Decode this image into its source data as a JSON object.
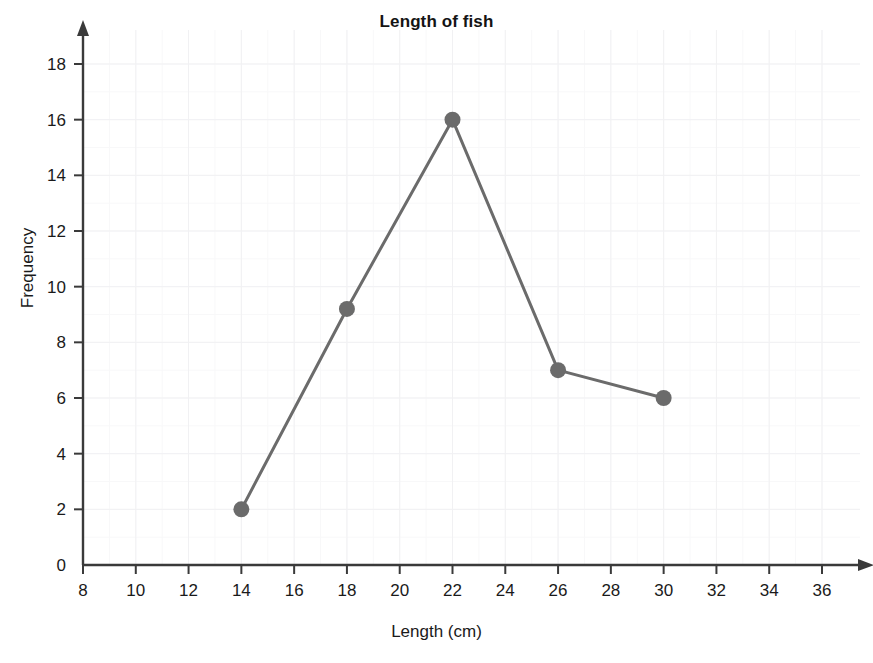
{
  "chart_data": {
    "type": "line",
    "title": "Length of fish",
    "xlabel": "Length (cm)",
    "ylabel": "Frequency",
    "xlim": [
      8,
      36
    ],
    "ylim": [
      0,
      18
    ],
    "xticks": [
      8,
      10,
      12,
      14,
      16,
      18,
      20,
      22,
      24,
      26,
      28,
      30,
      32,
      34,
      36
    ],
    "yticks": [
      0,
      2,
      4,
      6,
      8,
      10,
      12,
      14,
      16,
      18
    ],
    "grid": true,
    "legend": null,
    "series": [
      {
        "name": "Frequency of fish length",
        "x": [
          14,
          18,
          22,
          26,
          30
        ],
        "values": [
          2,
          9.2,
          16,
          7,
          6
        ],
        "color": "#6b6b6b",
        "marker": "circle"
      }
    ],
    "points": [
      {
        "x": 14,
        "y": 2
      },
      {
        "x": 18,
        "y": 9.2
      },
      {
        "x": 22,
        "y": 16
      },
      {
        "x": 26,
        "y": 7
      },
      {
        "x": 30,
        "y": 6
      }
    ],
    "colors": {
      "line": "#6b6b6b",
      "marker": "#6b6b6b",
      "axis": "#3a3a3a",
      "grid_major": "#f1f1f3",
      "grid_minor": "#f8f8f9",
      "text": "#1a1a1a",
      "background": "#ffffff"
    }
  }
}
